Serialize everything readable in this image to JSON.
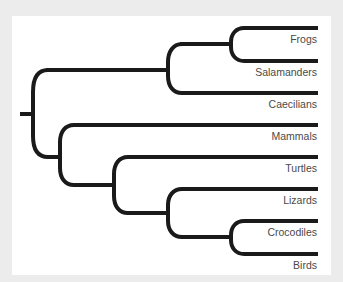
{
  "diagram": {
    "type": "phylogenetic-tree",
    "colors": {
      "background": "#ececec",
      "panel": "#ffffff",
      "branch": "#1a1a1a",
      "label": "#4a4a4a"
    },
    "taxa": [
      {
        "label": "Frogs",
        "y": 28
      },
      {
        "label": "Salamanders",
        "y": 61
      },
      {
        "label": "Caecilians",
        "y": 93
      },
      {
        "label": "Mammals",
        "y": 125
      },
      {
        "label": "Turtles",
        "y": 157
      },
      {
        "label": "Lizards",
        "y": 189
      },
      {
        "label": "Crocodiles",
        "y": 221
      },
      {
        "label": "Birds",
        "y": 254
      }
    ],
    "topology": "((Frogs,Salamanders),Caecilians),(Mammals,(Turtles,(Lizards,(Crocodiles,Birds))))"
  }
}
